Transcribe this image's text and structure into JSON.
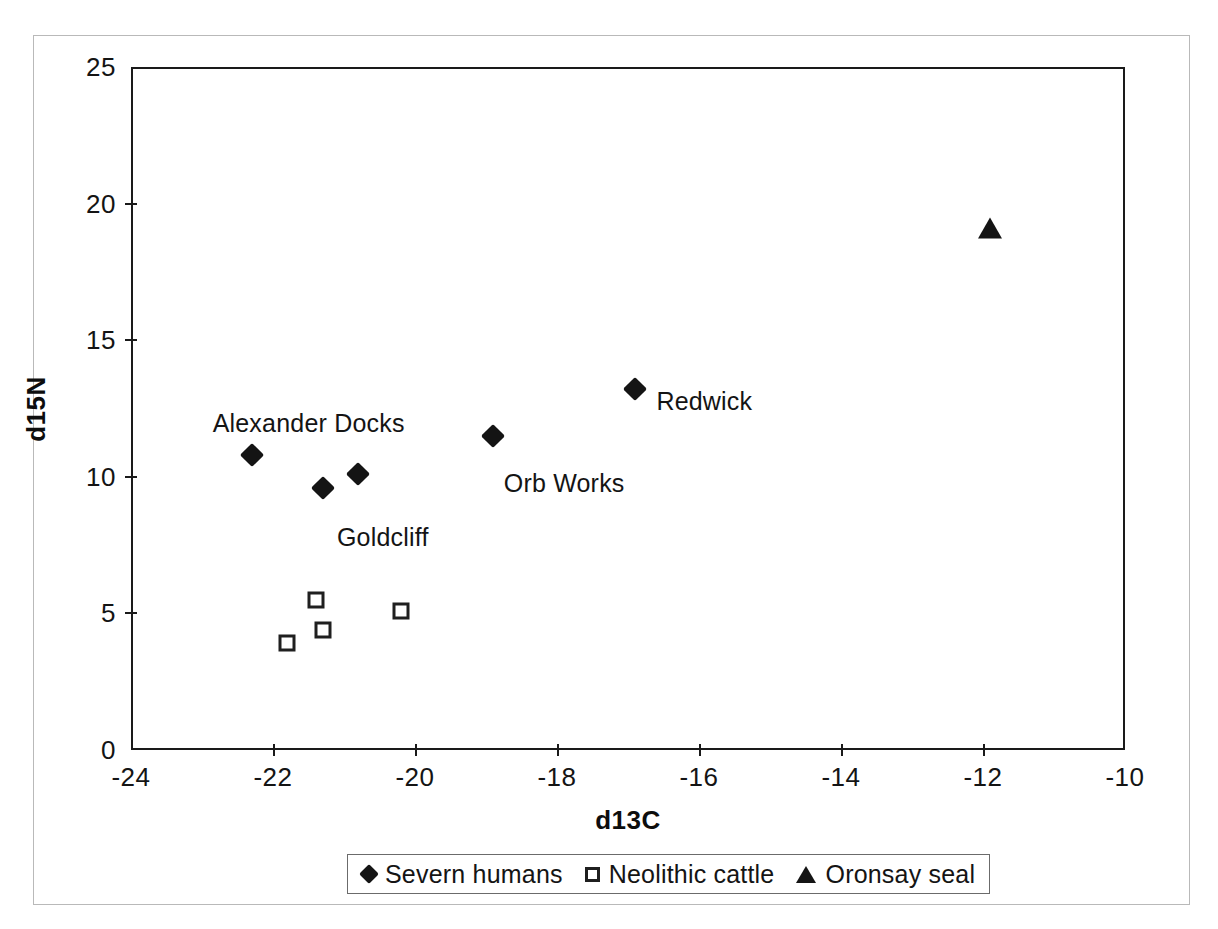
{
  "chart_data": {
    "type": "scatter",
    "title": "",
    "xlabel": "d13C",
    "ylabel": "d15N",
    "xlim": [
      -24,
      -10
    ],
    "ylim": [
      0,
      25
    ],
    "xticks": [
      "-24",
      "-22",
      "-20",
      "-18",
      "-16",
      "-14",
      "-12",
      "-10"
    ],
    "xtick_values": [
      -24,
      -22,
      -20,
      -18,
      -16,
      -14,
      -12,
      -10
    ],
    "yticks": [
      "0",
      "5",
      "10",
      "15",
      "20",
      "25"
    ],
    "ytick_values": [
      0,
      5,
      10,
      15,
      20,
      25
    ],
    "grid": false,
    "legend_position": "bottom",
    "series": [
      {
        "name": "Severn humans",
        "marker": "filled-diamond",
        "color": "#141414",
        "points": [
          {
            "x": -22.3,
            "y": 10.8
          },
          {
            "x": -21.3,
            "y": 9.6
          },
          {
            "x": -20.8,
            "y": 10.1
          },
          {
            "x": -18.9,
            "y": 11.5
          },
          {
            "x": -16.9,
            "y": 13.2
          }
        ]
      },
      {
        "name": "Neolithic cattle",
        "marker": "open-square",
        "color": "#1f1f1f",
        "points": [
          {
            "x": -21.8,
            "y": 3.9
          },
          {
            "x": -21.4,
            "y": 5.5
          },
          {
            "x": -21.3,
            "y": 4.4
          },
          {
            "x": -20.2,
            "y": 5.1
          }
        ]
      },
      {
        "name": "Oronsay seal",
        "marker": "filled-triangle",
        "color": "#141414",
        "points": [
          {
            "x": -11.9,
            "y": 19.1
          }
        ]
      }
    ],
    "annotations": [
      {
        "text": "Alexander Docks",
        "x": -22.85,
        "y": 12.5
      },
      {
        "text": "Goldcliff",
        "x": -21.1,
        "y": 8.3
      },
      {
        "text": "Orb Works",
        "x": -18.75,
        "y": 10.3
      },
      {
        "text": "Redwick",
        "x": -16.6,
        "y": 13.3
      }
    ]
  },
  "legend": {
    "items": [
      {
        "symbol": "filled-diamond-icon",
        "label": "Severn humans"
      },
      {
        "symbol": "open-square-icon",
        "label": "Neolithic cattle"
      },
      {
        "symbol": "filled-triangle-icon",
        "label": "Oronsay seal"
      }
    ]
  }
}
